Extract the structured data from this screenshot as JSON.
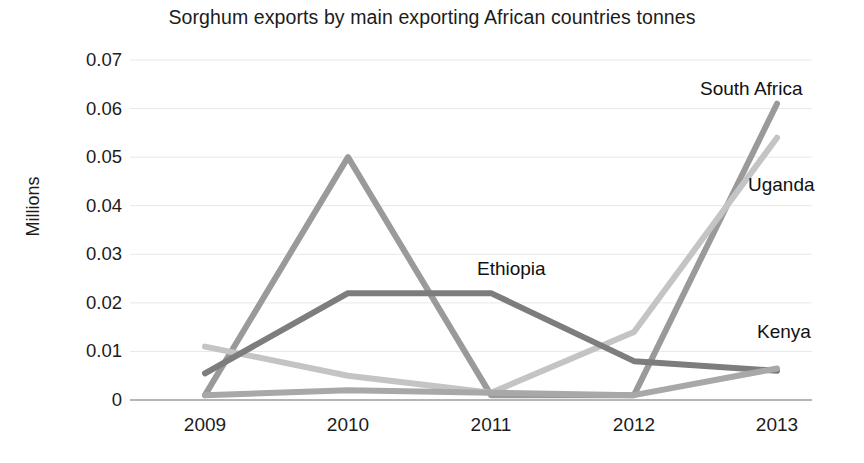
{
  "chart_data": {
    "type": "line",
    "title": "Sorghum exports by main exporting African countries tonnes",
    "xlabel": "",
    "ylabel": "Millions",
    "categories": [
      "2009",
      "2010",
      "2011",
      "2012",
      "2013"
    ],
    "yticks": [
      "0.07",
      "0.06",
      "0.05",
      "0.04",
      "0.03",
      "0.02",
      "0.01",
      "0"
    ],
    "ytick_values": [
      0.07,
      0.06,
      0.05,
      0.04,
      0.03,
      0.02,
      0.01,
      0
    ],
    "ylim": [
      0,
      0.07
    ],
    "grid": "horizontal",
    "legend_position": "inline-labels-right",
    "series": [
      {
        "name": "South Africa",
        "color": "#9a9a9a",
        "values": [
          0.001,
          0.05,
          0.001,
          0.001,
          0.061
        ],
        "label_x": 700,
        "label_y": 78
      },
      {
        "name": "Uganda",
        "color": "#c4c4c4",
        "values": [
          0.011,
          0.005,
          0.0015,
          0.014,
          0.054
        ],
        "label_x": 748,
        "label_y": 174
      },
      {
        "name": "Ethiopia",
        "color": "#7d7d7d",
        "values": [
          0.0055,
          0.022,
          0.022,
          0.008,
          0.006
        ],
        "label_x": 477,
        "label_y": 258
      },
      {
        "name": "Kenya",
        "color": "#a8a8a8",
        "values": [
          0.001,
          0.002,
          0.0015,
          0.001,
          0.0065
        ],
        "label_x": 757,
        "label_y": 321
      }
    ],
    "axis_color": "#9d9d9d",
    "gridline_color": "#e8e8e8"
  },
  "plot_geometry": {
    "left": 130,
    "right": 812,
    "top": 60,
    "bottom": 400
  }
}
